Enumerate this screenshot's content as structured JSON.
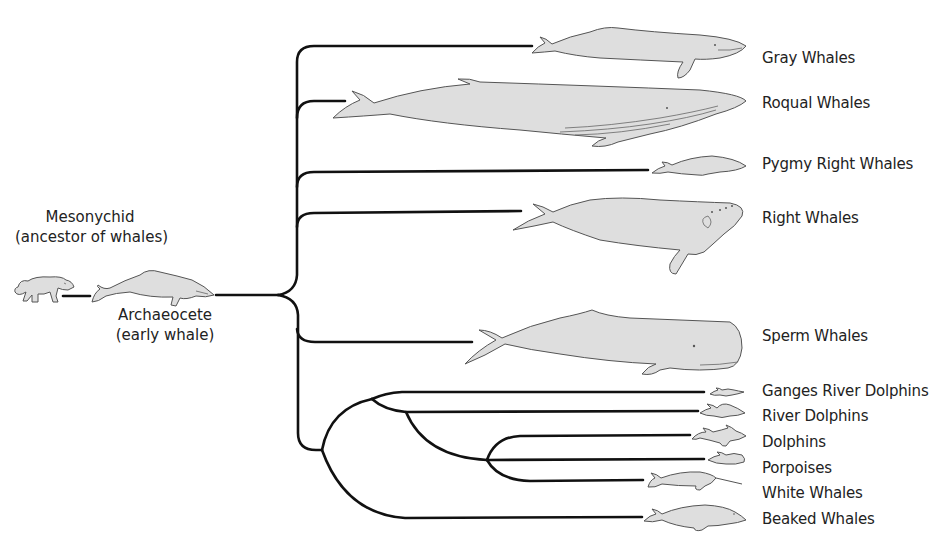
{
  "ancestors": {
    "mesonychid": {
      "name": "Mesonychid",
      "description": "(ancestor of whales)"
    },
    "archaeocete": {
      "name": "Archaeocete",
      "description": "(early whale)"
    }
  },
  "taxa": [
    {
      "id": "gray-whales",
      "label": "Gray Whales"
    },
    {
      "id": "roqual-whales",
      "label": "Roqual Whales"
    },
    {
      "id": "pygmy-right-whales",
      "label": "Pygmy Right Whales"
    },
    {
      "id": "right-whales",
      "label": "Right Whales"
    },
    {
      "id": "sperm-whales",
      "label": "Sperm Whales"
    },
    {
      "id": "ganges-river-dolphins",
      "label": "Ganges River Dolphins"
    },
    {
      "id": "river-dolphins",
      "label": "River Dolphins"
    },
    {
      "id": "dolphins",
      "label": "Dolphins"
    },
    {
      "id": "porpoises",
      "label": "Porpoises"
    },
    {
      "id": "white-whales",
      "label": "White Whales"
    },
    {
      "id": "beaked-whales",
      "label": "Beaked Whales"
    }
  ],
  "colors": {
    "branch": "#111111",
    "animal_fill": "#dedede",
    "animal_outline": "#555555",
    "text": "#222222"
  }
}
